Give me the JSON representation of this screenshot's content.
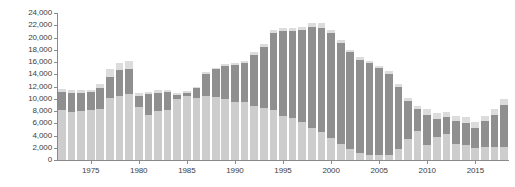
{
  "chart_data": {
    "type": "bar",
    "stacked": true,
    "title": "",
    "subtitle": "",
    "xlabel": "",
    "ylabel": "",
    "ylim": [
      0,
      24000
    ],
    "ystep": 2000,
    "grid": false,
    "legend_position": "none",
    "y_tick_labels": [
      "24,000",
      "22,000",
      "20,000",
      "18,000",
      "16,000",
      "14,000",
      "12,000",
      "10,000",
      "8,000",
      "6,000",
      "4,000",
      "2,000",
      "0"
    ],
    "y_tick_values": [
      24000,
      22000,
      20000,
      18000,
      16000,
      14000,
      12000,
      10000,
      8000,
      6000,
      4000,
      2000,
      0
    ],
    "x_tick_labels": [
      "1975",
      "1980",
      "1985",
      "1990",
      "1995",
      "2000",
      "2005",
      "2010",
      "2015"
    ],
    "x_tick_values": [
      1975,
      1980,
      1985,
      1990,
      1995,
      2000,
      2005,
      2010,
      2015
    ],
    "categories": [
      1972,
      1973,
      1974,
      1975,
      1976,
      1977,
      1978,
      1979,
      1980,
      1981,
      1982,
      1983,
      1984,
      1985,
      1986,
      1987,
      1988,
      1989,
      1990,
      1991,
      1992,
      1993,
      1994,
      1995,
      1996,
      1997,
      1998,
      1999,
      2000,
      2001,
      2002,
      2003,
      2004,
      2005,
      2006,
      2007,
      2008,
      2009,
      2010,
      2011,
      2012,
      2013,
      2014,
      2015,
      2016,
      2017,
      2018
    ],
    "colors": {
      "bottom": "#cdcdcd",
      "middle": "#8f8f8f",
      "top": "#dcdcdc",
      "axis": "#8a8a8a",
      "text": "#3d3d3d",
      "background": "#ffffff"
    },
    "series": [
      {
        "name": "bottom",
        "color": "#cdcdcd",
        "values": [
          8200,
          7800,
          8000,
          8100,
          8400,
          10200,
          10400,
          10800,
          8700,
          7400,
          8000,
          8200,
          10000,
          10400,
          10100,
          10400,
          10300,
          9900,
          9500,
          9400,
          8800,
          8500,
          8100,
          7200,
          6800,
          6200,
          5300,
          4600,
          3600,
          2600,
          1800,
          1200,
          900,
          900,
          900,
          1800,
          3500,
          4800,
          2500,
          3800,
          4200,
          2600,
          2500,
          2000,
          2100,
          2100,
          2100
        ]
      },
      {
        "name": "middle",
        "color": "#8f8f8f",
        "values": [
          2900,
          3200,
          3000,
          3000,
          3300,
          3300,
          4300,
          4000,
          1800,
          3400,
          3000,
          2900,
          600,
          500,
          1600,
          3600,
          4500,
          5400,
          6000,
          6400,
          8400,
          9900,
          12600,
          13800,
          14200,
          15000,
          16400,
          17000,
          17100,
          16500,
          15800,
          15200,
          14900,
          14100,
          13200,
          10200,
          6200,
          3600,
          4900,
          2900,
          2800,
          3700,
          3600,
          3300,
          4200,
          5300,
          6900
        ]
      },
      {
        "name": "top",
        "color": "#dcdcdc",
        "values": [
          500,
          400,
          400,
          400,
          700,
          1300,
          1100,
          1300,
          400,
          300,
          400,
          400,
          300,
          300,
          300,
          300,
          300,
          300,
          300,
          300,
          400,
          500,
          600,
          500,
          500,
          500,
          600,
          700,
          600,
          500,
          400,
          400,
          400,
          400,
          400,
          400,
          400,
          400,
          900,
          900,
          900,
          900,
          900,
          900,
          900,
          900,
          900
        ]
      }
    ],
    "totals": [
      11600,
      11400,
      11400,
      11500,
      12400,
      14800,
      15800,
      16100,
      10900,
      11100,
      11400,
      11500,
      10900,
      11200,
      12000,
      14300,
      15100,
      15600,
      15800,
      16100,
      17600,
      18900,
      21300,
      21500,
      21500,
      21700,
      22300,
      22300,
      21300,
      19600,
      18000,
      16800,
      16200,
      15400,
      14500,
      12400,
      10100,
      8800,
      8300,
      7600,
      7900,
      7200,
      7000,
      6200,
      7200,
      8300,
      9900
    ]
  }
}
